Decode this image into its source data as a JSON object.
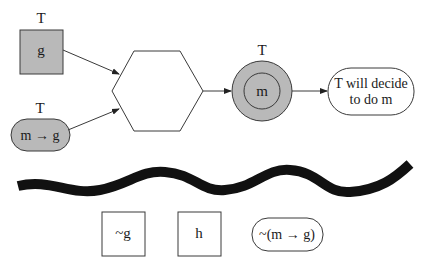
{
  "colors": {
    "stroke": "#3a3a3a",
    "gray_fill": "#b9b9b9",
    "wave": "#111111",
    "background": "#ffffff"
  },
  "top_row": {
    "g_box": {
      "owner_label": "T",
      "text": "g"
    },
    "m_implies_g": {
      "owner_label": "T",
      "text": "m → g"
    },
    "hexagon": {
      "text": ""
    },
    "m_circle": {
      "owner_label": "T",
      "text": "m"
    },
    "conclusion": {
      "line1": "T will decide",
      "line2": "to do m"
    }
  },
  "divider": {
    "type": "wavy-line"
  },
  "bottom_row": {
    "not_g_box": {
      "text": "~g"
    },
    "h_box": {
      "text": "h"
    },
    "not_m_implies_g": {
      "text": "~(m → g)"
    }
  }
}
